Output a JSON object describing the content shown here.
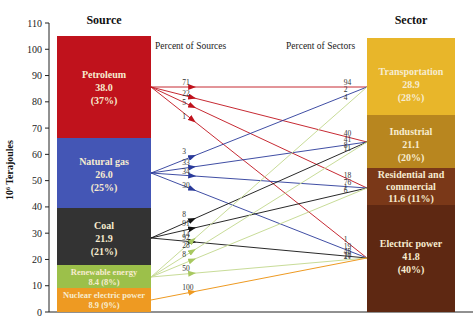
{
  "chart_data": {
    "type": "sankey",
    "title": "",
    "ylabel": "10^6 Terajoules",
    "ylim": [
      0,
      110
    ],
    "yticks": [
      0,
      10,
      20,
      30,
      40,
      50,
      60,
      70,
      80,
      90,
      100,
      110
    ],
    "source_header": "Source",
    "sector_header": "Sector",
    "percent_sources_label": "Percent of Sources",
    "percent_sectors_label": "Percent of Sectors",
    "sources": [
      {
        "name": "Petroleum",
        "value": 38.0,
        "percent": "37%",
        "value_text": "38.0",
        "percent_text": "(37%)",
        "color": "#c0121c"
      },
      {
        "name": "Natural gas",
        "value": 26.0,
        "percent": "25%",
        "value_text": "26.0",
        "percent_text": "(25%)",
        "color": "#4456b5"
      },
      {
        "name": "Coal",
        "value": 21.9,
        "percent": "21%",
        "value_text": "21.9",
        "percent_text": "(21%)",
        "color": "#333333"
      },
      {
        "name": "Renewable energy",
        "value": 8.4,
        "percent": "8%",
        "value_text": "8.4 (8%)",
        "color": "#9cc04a"
      },
      {
        "name": "Nuclear electric power",
        "value": 8.9,
        "percent": "9%",
        "value_text": "8.9 (9%)",
        "color": "#ee9a22"
      }
    ],
    "sectors": [
      {
        "name": "Transportation",
        "value": 28.9,
        "percent": "28%",
        "value_text": "28.9",
        "percent_text": "(28%)",
        "color": "#e8b62a"
      },
      {
        "name": "Industrial",
        "value": 21.1,
        "percent": "20%",
        "value_text": "21.1",
        "percent_text": "(20%)",
        "color": "#b8861f"
      },
      {
        "name": "Residential and commercial",
        "line1": "Residential and",
        "line2": "commercial",
        "value": 11.6,
        "percent": "11%",
        "value_text": "11.6 (11%)",
        "color": "#7a3818"
      },
      {
        "name": "Electric power",
        "value": 41.8,
        "percent": "40%",
        "value_text": "41.8",
        "percent_text": "(40%)",
        "color": "#5e2812"
      }
    ],
    "flows": [
      {
        "source": "Petroleum",
        "sector": "Transportation",
        "pct_of_source": 71,
        "pct_of_sector": 94
      },
      {
        "source": "Petroleum",
        "sector": "Industrial",
        "pct_of_source": 22,
        "pct_of_sector": 40
      },
      {
        "source": "Petroleum",
        "sector": "Residential and commercial",
        "pct_of_source": 5,
        "pct_of_sector": 18
      },
      {
        "source": "Petroleum",
        "sector": "Electric power",
        "pct_of_source": 1,
        "pct_of_sector": 1
      },
      {
        "source": "Natural gas",
        "sector": "Transportation",
        "pct_of_source": 3,
        "pct_of_sector": 2
      },
      {
        "source": "Natural gas",
        "sector": "Industrial",
        "pct_of_source": 33,
        "pct_of_sector": 41
      },
      {
        "source": "Natural gas",
        "sector": "Residential and commercial",
        "pct_of_source": 34,
        "pct_of_sector": 76
      },
      {
        "source": "Natural gas",
        "sector": "Electric power",
        "pct_of_source": 30,
        "pct_of_sector": 19
      },
      {
        "source": "Coal",
        "sector": "Industrial",
        "pct_of_source": 8,
        "pct_of_sector": 8
      },
      {
        "source": "Coal",
        "sector": "Residential and commercial",
        "pct_of_source": 91,
        "pct_of_sector": 1
      },
      {
        "source": "Coal",
        "sector": "Electric power",
        "pct_of_source": 92,
        "pct_of_sector": 48
      },
      {
        "source": "Renewable energy",
        "sector": "Transportation",
        "pct_of_source": 14,
        "pct_of_sector": 4
      },
      {
        "source": "Renewable energy",
        "sector": "Industrial",
        "pct_of_source": 28,
        "pct_of_sector": 11
      },
      {
        "source": "Renewable energy",
        "sector": "Residential and commercial",
        "pct_of_source": 8,
        "pct_of_sector": 6
      },
      {
        "source": "Renewable energy",
        "sector": "Electric power",
        "pct_of_source": 50,
        "pct_of_sector": 10
      },
      {
        "source": "Nuclear electric power",
        "sector": "Electric power",
        "pct_of_source": 100,
        "pct_of_sector": 21
      }
    ]
  },
  "labels": {
    "source_header": "Source",
    "sector_header": "Sector",
    "percent_sources": "Percent of Sources",
    "percent_sectors": "Percent of Sectors",
    "ylabel": "10⁶ Terajoules"
  }
}
